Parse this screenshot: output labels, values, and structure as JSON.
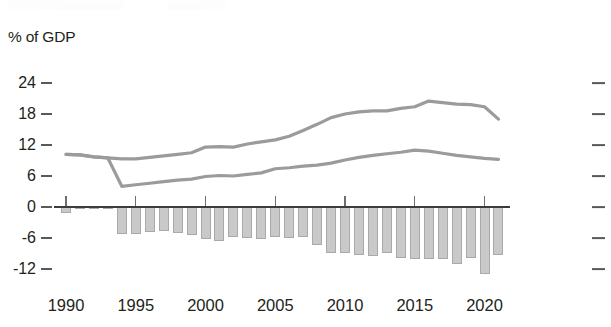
{
  "chart_data": {
    "type": "bar",
    "title": "",
    "ylabel": "% of GDP",
    "xlabel": "",
    "ylim": [
      -14.5,
      25.5
    ],
    "xlim": [
      1989.3,
      2021.7
    ],
    "grid": false,
    "legend": "none",
    "yticks": [
      24,
      18,
      12,
      6,
      0,
      -6,
      -12
    ],
    "ytick_labels": [
      "24",
      "18",
      "12",
      "6",
      "0",
      "-6",
      "-12"
    ],
    "xticks": [
      1990,
      1995,
      2000,
      2005,
      2010,
      2015,
      2020
    ],
    "xtick_labels": [
      "1990",
      "1995",
      "2000",
      "2005",
      "2010",
      "2015",
      "2020"
    ],
    "x": [
      1990,
      1991,
      1992,
      1993,
      1994,
      1995,
      1996,
      1997,
      1998,
      1999,
      2000,
      2001,
      2002,
      2003,
      2004,
      2005,
      2006,
      2007,
      2008,
      2009,
      2010,
      2011,
      2012,
      2013,
      2014,
      2015,
      2016,
      2017,
      2018,
      2019,
      2020,
      2021
    ],
    "series": [
      {
        "name": "bars",
        "type": "bar",
        "values": [
          -1.1,
          -0.3,
          -0.4,
          -0.4,
          -5.2,
          -5.3,
          -4.8,
          -4.7,
          -5.0,
          -5.4,
          -6.2,
          -6.6,
          -5.9,
          -6.0,
          -6.1,
          -5.9,
          -6.0,
          -5.9,
          -7.4,
          -8.9,
          -8.9,
          -9.2,
          -9.4,
          -8.9,
          -9.9,
          -10.1,
          -10.0,
          -10.0,
          -11.1,
          -9.8,
          -13.0,
          -9.3
        ],
        "color": "#c9c9c9",
        "edge_color": "#a9a9a9"
      },
      {
        "name": "upper-line",
        "type": "line",
        "values": [
          10.2,
          10.1,
          9.7,
          9.5,
          9.3,
          9.3,
          9.6,
          9.9,
          10.2,
          10.5,
          11.6,
          11.7,
          11.6,
          12.2,
          12.6,
          13.0,
          13.7,
          14.8,
          16.0,
          17.3,
          18.0,
          18.4,
          18.6,
          18.6,
          19.1,
          19.4,
          20.5,
          20.2,
          19.9,
          19.8,
          19.4,
          17.0
        ],
        "color": "#9b9b9b"
      },
      {
        "name": "lower-line",
        "type": "line",
        "values": [
          10.2,
          10.1,
          9.7,
          9.5,
          4.0,
          4.3,
          4.6,
          4.9,
          5.2,
          5.4,
          5.9,
          6.1,
          6.0,
          6.3,
          6.6,
          7.4,
          7.6,
          7.9,
          8.1,
          8.5,
          9.1,
          9.6,
          10.0,
          10.3,
          10.6,
          11.0,
          10.8,
          10.4,
          10.0,
          9.7,
          9.4,
          9.2
        ],
        "color": "#9b9b9b"
      }
    ]
  },
  "axes": {
    "y_axis_title": "% of GDP"
  }
}
